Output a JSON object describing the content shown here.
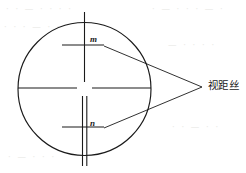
{
  "figure": {
    "type": "technical-diagram",
    "labels": {
      "upper_hair": "m",
      "lower_hair": "n",
      "callout": "视距丝"
    },
    "colors": {
      "stroke": "#1a1a1a",
      "background": "#ffffff",
      "ghost": "#e9e9e6"
    },
    "geometry": {
      "circle": {
        "cx": 84.5,
        "cy": 89,
        "r": 66.5
      },
      "vertical_hair": {
        "x": 84.5,
        "y1": 12,
        "y2": 166
      },
      "horizontal_hair": {
        "y": 88,
        "x1": 18,
        "x2": 151
      },
      "center_gap": {
        "half_width": 7,
        "half_height": 7
      },
      "double_line_offset": 4,
      "upper_tick": {
        "y": 45,
        "x1": 62,
        "x2": 104
      },
      "lower_tick": {
        "y": 127,
        "x1": 62,
        "x2": 104
      },
      "leader_apex": {
        "x": 202,
        "y": 87
      },
      "leader_upper_start": {
        "x": 104,
        "y": 46
      },
      "leader_lower_start": {
        "x": 104,
        "y": 128
      }
    }
  },
  "ghost_text": {
    "rows": [
      "· · — · · · ·",
      "· — · · · — ·",
      "· · · — · ·",
      "— · · · ·",
      "· · — · ·",
      "· — · · ·"
    ]
  }
}
